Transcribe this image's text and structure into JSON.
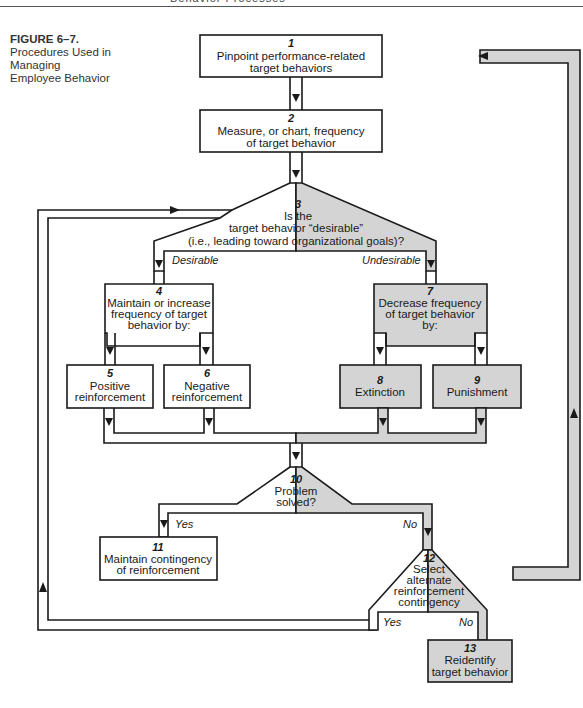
{
  "page": {
    "running_head": "Behavior Processes"
  },
  "caption": {
    "label": "FIGURE 6–7.",
    "title_lines": [
      "Procedures Used in",
      "Managing",
      "Employee Behavior"
    ]
  },
  "colors": {
    "shade": "#d4d4d4",
    "stroke": "#1a1a1a",
    "background": "#ffffff"
  },
  "nodes": {
    "n1": {
      "num": "1",
      "lines": [
        "Pinpoint performance-related",
        "target behaviors"
      ]
    },
    "n2": {
      "num": "2",
      "lines": [
        "Measure, or chart, frequency",
        "of target behavior"
      ]
    },
    "n3": {
      "num": "3",
      "lines": [
        "Is the",
        "target behavior “desirable”",
        "(i.e., leading toward organizational goals)?"
      ]
    },
    "n4": {
      "num": "4",
      "lines": [
        "Maintain or increase",
        "frequency of target",
        "behavior by:"
      ]
    },
    "n5": {
      "num": "5",
      "lines": [
        "Positive",
        "reinforcement"
      ]
    },
    "n6": {
      "num": "6",
      "lines": [
        "Negative",
        "reinforcement"
      ]
    },
    "n7": {
      "num": "7",
      "lines": [
        "Decrease frequency",
        "of target behavior",
        "by:"
      ]
    },
    "n8": {
      "num": "8",
      "lines": [
        "Extinction"
      ]
    },
    "n9": {
      "num": "9",
      "lines": [
        "Punishment"
      ]
    },
    "n10": {
      "num": "10",
      "lines": [
        "Problem",
        "solved?"
      ]
    },
    "n11": {
      "num": "11",
      "lines": [
        "Maintain contingency",
        "of reinforcement"
      ]
    },
    "n12": {
      "num": "12",
      "lines": [
        "Select",
        "alternate",
        "reinforcement",
        "contingency"
      ]
    },
    "n13": {
      "num": "13",
      "lines": [
        "Reidentify",
        "target behavior"
      ]
    }
  },
  "branches": {
    "desirable": "Desirable",
    "undesirable": "Undesirable",
    "n10_yes": "Yes",
    "n10_no": "No",
    "n12_yes": "Yes",
    "n12_no": "No"
  }
}
